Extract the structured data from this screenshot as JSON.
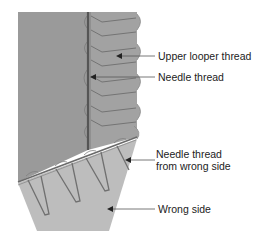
{
  "diagram": {
    "colors": {
      "fabric_right_side": "#9a9a9a",
      "serged_area": "#a2a2a2",
      "wrong_side": "#bdbdbd",
      "thread": "#6e6e6e",
      "needle_line": "#555555",
      "leader": "#555555",
      "text": "#222222"
    },
    "labels": [
      {
        "id": "upper-looper-thread",
        "text": "Upper looper thread"
      },
      {
        "id": "needle-thread",
        "text": "Needle thread"
      },
      {
        "id": "needle-thread-wrong-side-line1",
        "text": "Needle thread"
      },
      {
        "id": "needle-thread-wrong-side-line2",
        "text": "from wrong side"
      },
      {
        "id": "wrong-side",
        "text": "Wrong side"
      }
    ]
  }
}
